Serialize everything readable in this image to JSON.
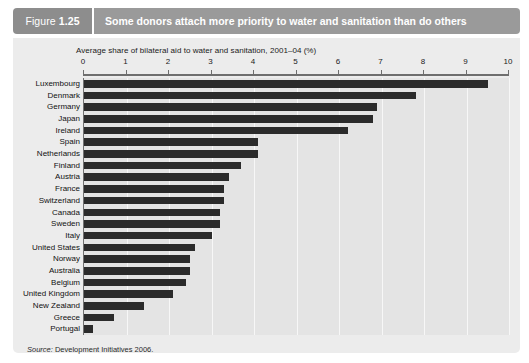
{
  "figure": {
    "tab_word": "Figure",
    "tab_number": "1.25",
    "title": "Some donors attach more priority to water and sanitation than do others",
    "source_prefix": "Source:",
    "source_text": " Development Initiatives 2006.",
    "colors": {
      "tab_bg": "#8d8d8d",
      "title_bg": "#9a9a9a",
      "panel_bg": "#ececec",
      "plot_bg": "#e4e4e4",
      "bar": "#2b2b2b",
      "axis": "#6e6e6e",
      "gridline": "#f7f7f7"
    }
  },
  "chart_data": {
    "type": "bar",
    "orientation": "horizontal",
    "title": "Some donors attach more priority to water and sanitation than do others",
    "xlabel": "Average share of bilateral aid to water and sanitation, 2001–04 (%)",
    "ylabel": "",
    "xlim": [
      0,
      10
    ],
    "xticks": [
      0,
      1,
      2,
      3,
      4,
      5,
      6,
      7,
      8,
      9,
      10
    ],
    "xticklabels": [
      "0",
      "1",
      "2",
      "3",
      "4",
      "5",
      "6",
      "7",
      "8",
      "9",
      "10"
    ],
    "grid": true,
    "grid_axis": "x",
    "legend": false,
    "categories": [
      "Luxembourg",
      "Denmark",
      "Germany",
      "Japan",
      "Ireland",
      "Spain",
      "Netherlands",
      "Finland",
      "Austria",
      "France",
      "Switzerland",
      "Canada",
      "Sweden",
      "Italy",
      "United States",
      "Norway",
      "Australia",
      "Belgium",
      "United Kingdom",
      "New Zealand",
      "Greece",
      "Portugal"
    ],
    "values": [
      9.5,
      7.8,
      6.9,
      6.8,
      6.2,
      4.1,
      4.1,
      3.7,
      3.4,
      3.3,
      3.3,
      3.2,
      3.2,
      3.0,
      2.6,
      2.5,
      2.5,
      2.4,
      2.1,
      1.4,
      0.7,
      0.2
    ]
  }
}
